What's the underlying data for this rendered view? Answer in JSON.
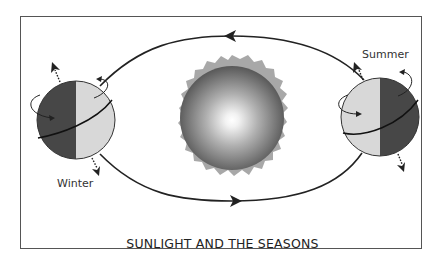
{
  "diagram": {
    "title": "SUNLIGHT AND THE SEASONS",
    "labels": {
      "winter": "Winter",
      "summer": "Summer"
    },
    "elements": [
      "sun",
      "earth-winter",
      "earth-summer",
      "orbit-path"
    ],
    "colors": {
      "frame": "#555555",
      "orbit": "#222222",
      "corona": "#a8a8a8",
      "earth_dark": "#4a4a4a",
      "earth_light": "#d6d6d6"
    }
  }
}
